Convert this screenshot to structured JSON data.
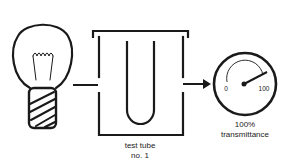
{
  "diagram": {
    "title": "",
    "components": [
      {
        "id": "light-source",
        "kind": "light-bulb-icon"
      },
      {
        "id": "sample-holder",
        "kind": "test-tube-in-chamber"
      },
      {
        "id": "detector",
        "kind": "meter-gauge-icon"
      }
    ],
    "flow": [
      "light-source",
      "sample-holder",
      "detector"
    ],
    "labels": {
      "test_tube_line1": "test tube",
      "test_tube_line2": "no. 1",
      "meter_line1": "100%",
      "meter_line2": "transmittance",
      "meter_min": "0",
      "meter_max": "100"
    },
    "meter_reading_percent": 100,
    "colors": {
      "stroke": "#1a1a1a",
      "background": "#ffffff"
    }
  }
}
